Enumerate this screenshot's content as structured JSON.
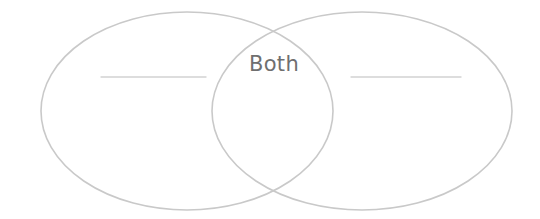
{
  "page": {
    "kind": "venn-diagram-worksheet",
    "width": 540,
    "height": 219,
    "background_color": "#ffffff"
  },
  "diagram": {
    "type": "venn-two-circle",
    "stroke_color": "#c9c9c9",
    "stroke_width": 1.6,
    "fill": "none",
    "left_circle": {
      "label": "",
      "center_x": 187,
      "center_y": 111,
      "radius_x": 146,
      "radius_y": 99
    },
    "right_circle": {
      "label": "",
      "center_x": 362,
      "center_y": 111,
      "radius_x": 150,
      "radius_y": 99
    },
    "intersection": {
      "label": "Both",
      "label_color": "#6f6f6f",
      "label_x": 274,
      "label_y": 70
    }
  },
  "blanks": [
    {
      "name": "left-blank-line",
      "value": "",
      "placeholder": "",
      "x1": 101,
      "y1": 77,
      "x2": 206,
      "y2": 77,
      "color": "#d2d2d2"
    },
    {
      "name": "right-blank-line",
      "value": "",
      "placeholder": "",
      "x1": 351,
      "y1": 77,
      "x2": 461,
      "y2": 77,
      "color": "#d2d2d2"
    }
  ]
}
